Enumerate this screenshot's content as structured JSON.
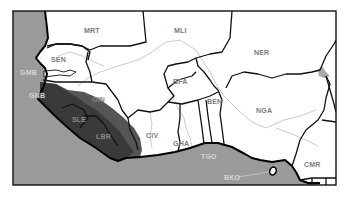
{
  "map": {
    "region": "West Africa",
    "colors": {
      "ocean": "#9a9a9a",
      "land": "#ffffff",
      "highlight_dark": "#3a3a3a",
      "highlight_mid": "#555555",
      "border": "#111111",
      "river": "#c4c4c4",
      "lake": "#a8a8a8",
      "frame": "#111111"
    },
    "countries": [
      {
        "code": "MRT",
        "label": "MRT",
        "x": 92,
        "y": 31,
        "style": "land"
      },
      {
        "code": "MLI",
        "label": "MLI",
        "x": 182,
        "y": 31,
        "style": "land"
      },
      {
        "code": "NER",
        "label": "NER",
        "x": 262,
        "y": 53,
        "style": "land"
      },
      {
        "code": "SEN",
        "label": "SEN",
        "x": 59,
        "y": 60,
        "style": "land"
      },
      {
        "code": "GMB",
        "label": "GMB",
        "x": 22,
        "y": 73,
        "style": "sea"
      },
      {
        "code": "GNB",
        "label": "GNB",
        "x": 31,
        "y": 96,
        "style": "sea"
      },
      {
        "code": "GIN",
        "label": "GIN",
        "x": 99,
        "y": 100,
        "style": "dark"
      },
      {
        "code": "SLE",
        "label": "SLE",
        "x": 79,
        "y": 120,
        "style": "dark"
      },
      {
        "code": "LBR",
        "label": "LBR",
        "x": 103,
        "y": 137,
        "style": "dark"
      },
      {
        "code": "BFA",
        "label": "BFA",
        "x": 181,
        "y": 82,
        "style": "land"
      },
      {
        "code": "BEN",
        "label": "BEN",
        "x": 215,
        "y": 102,
        "style": "land"
      },
      {
        "code": "NGA",
        "label": "NGA",
        "x": 264,
        "y": 111,
        "style": "land"
      },
      {
        "code": "CIV",
        "label": "CIV",
        "x": 154,
        "y": 136,
        "style": "land"
      },
      {
        "code": "GHA",
        "label": "GHA",
        "x": 182,
        "y": 144,
        "style": "land"
      },
      {
        "code": "TGO",
        "label": "TGO",
        "x": 209,
        "y": 157,
        "style": "sea"
      },
      {
        "code": "CMR",
        "label": "CMR",
        "x": 311,
        "y": 165,
        "style": "land"
      },
      {
        "code": "BKO",
        "label": "BKO",
        "x": 227,
        "y": 178,
        "style": "sea"
      }
    ],
    "highlighted": [
      "GIN",
      "SLE",
      "LBR"
    ],
    "annotations": [
      {
        "label": "BKO",
        "target": "island",
        "leader": true
      }
    ]
  }
}
